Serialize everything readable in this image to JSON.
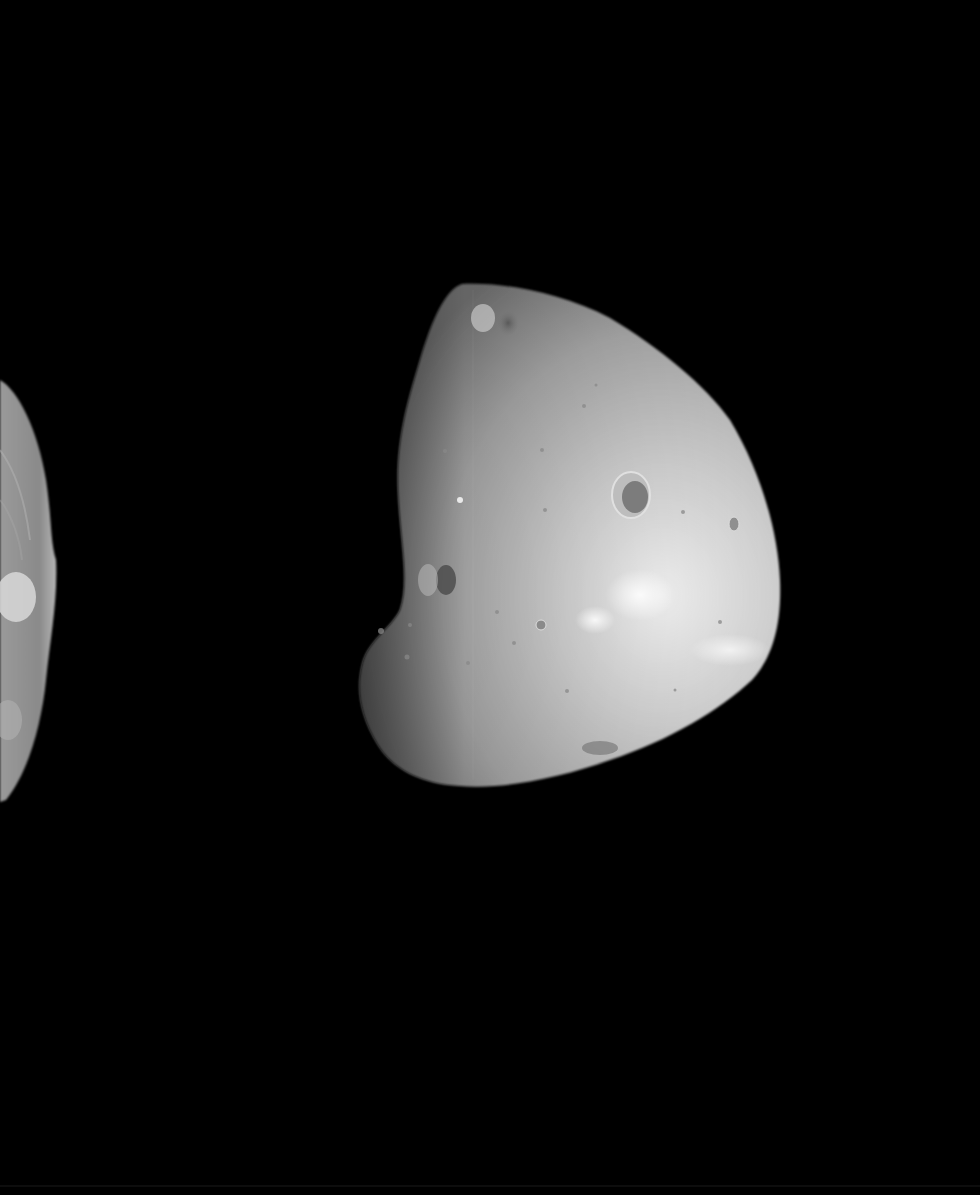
{
  "image": {
    "width": 980,
    "height": 1195,
    "background_color": "#000000",
    "description": "Grayscale space photograph of an irregular cratered moon against black space, with the limb of a second cratered body partially visible at the left edge",
    "subjects": [
      {
        "name": "main-moon",
        "tone": "light gray, brightest toward lower-right limb",
        "bbox": [
          358,
          282,
          780,
          788
        ],
        "features": [
          "large crater near center-right",
          "dark crater near top",
          "dark crater on left side",
          "bright patches lower center",
          "many small pits"
        ]
      },
      {
        "name": "partial-body-left",
        "tone": "medium gray, textured",
        "bbox": [
          0,
          378,
          56,
          802
        ],
        "features": [
          "bright bowl crater near middle",
          "streaked surface texture"
        ]
      }
    ],
    "colors": {
      "space": "#000000",
      "moon_shadow": "#6a6a6a",
      "moon_mid": "#a9a9a9",
      "moon_highlight": "#f2f2f2",
      "crater_dark": "#5a5a5a",
      "left_body": "#8c8c8c"
    }
  }
}
